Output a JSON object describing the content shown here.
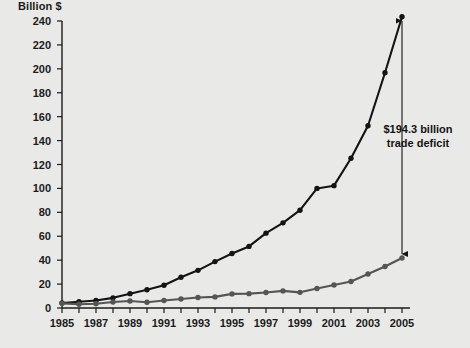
{
  "chart": {
    "background_color": "#e9e9e7",
    "axis_color": "#1b1b1b",
    "plot_left": 62,
    "plot_right": 402,
    "plot_top": 21,
    "plot_bottom": 308
  },
  "annotation": {
    "line1": "$194.3 billion",
    "line2": "trade deficit",
    "x": 418,
    "y": 136
  },
  "chart_data": {
    "type": "line",
    "title": "",
    "subtitle": "",
    "xlabel": "",
    "ylabel": "Billion $",
    "ylim": [
      0,
      240
    ],
    "xlim": [
      1985,
      2005
    ],
    "ytick_step": 20,
    "yticks": [
      0,
      20,
      40,
      60,
      80,
      100,
      120,
      140,
      160,
      180,
      200,
      220,
      240
    ],
    "xticks": [
      1985,
      1986,
      1987,
      1988,
      1989,
      1990,
      1991,
      1992,
      1993,
      1994,
      1995,
      1996,
      1997,
      1998,
      1999,
      2000,
      2001,
      2002,
      2003,
      2004,
      2005
    ],
    "xtick_labels_shown": [
      1985,
      1987,
      1989,
      1991,
      1993,
      1995,
      1997,
      1999,
      2001,
      2003,
      2005
    ],
    "grid": false,
    "legend_position": "none",
    "x": [
      1985,
      1986,
      1987,
      1988,
      1989,
      1990,
      1991,
      1992,
      1993,
      1994,
      1995,
      1996,
      1997,
      1998,
      1999,
      2000,
      2001,
      2002,
      2003,
      2004,
      2005
    ],
    "series": [
      {
        "name": "imports",
        "color": "#141414",
        "marker": "circle",
        "values": [
          4.2,
          5.2,
          6.3,
          8.5,
          12.0,
          15.2,
          19.0,
          25.7,
          31.5,
          38.8,
          45.6,
          51.5,
          62.6,
          71.2,
          81.8,
          100.0,
          102.3,
          125.2,
          152.4,
          196.7,
          243.5
        ]
      },
      {
        "name": "exports",
        "color": "#555555",
        "marker": "circle",
        "values": [
          3.9,
          3.1,
          3.5,
          5.0,
          5.8,
          4.8,
          6.3,
          7.5,
          8.8,
          9.3,
          11.8,
          12.0,
          12.9,
          14.3,
          13.1,
          16.3,
          19.2,
          22.1,
          28.4,
          34.7,
          41.8
        ]
      }
    ],
    "annotations": [
      {
        "text": "$194.3 billion trade deficit",
        "at_year": 2005,
        "from_value": 243.5,
        "to_value": 41.8,
        "gap": 194.3
      }
    ]
  }
}
